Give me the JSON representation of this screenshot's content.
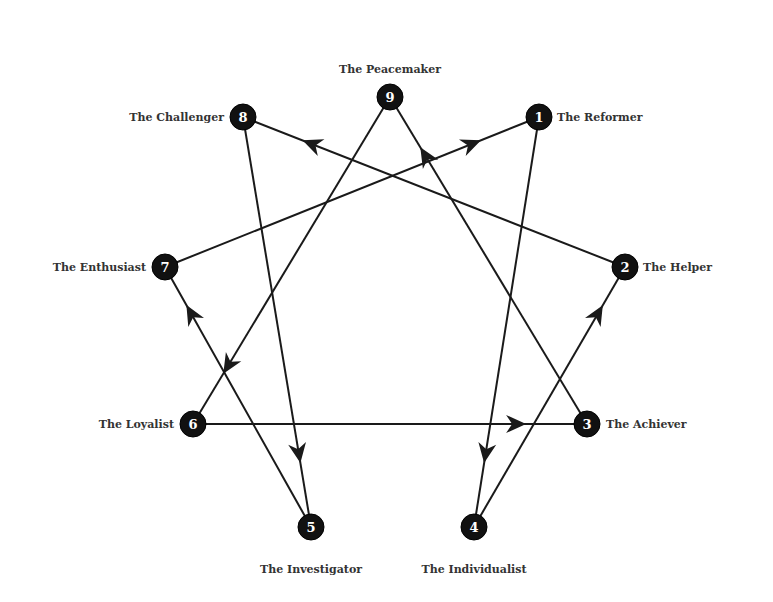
{
  "diagram": {
    "colors": {
      "node": "#111111",
      "line": "#1a1a1a",
      "label": "#333333",
      "background": "#ffffff"
    },
    "nodes": [
      {
        "id": "9",
        "label": "The Peacemaker",
        "x": 390,
        "y": 97,
        "lx": 390,
        "ly": 73,
        "anchor": "middle"
      },
      {
        "id": "1",
        "label": "The Reformer",
        "x": 539,
        "y": 117,
        "lx": 557,
        "ly": 121,
        "anchor": "start"
      },
      {
        "id": "2",
        "label": "The Helper",
        "x": 625,
        "y": 267,
        "lx": 643,
        "ly": 271,
        "anchor": "start"
      },
      {
        "id": "3",
        "label": "The Achiever",
        "x": 587,
        "y": 424,
        "lx": 606,
        "ly": 428,
        "anchor": "start"
      },
      {
        "id": "4",
        "label": "The Individualist",
        "x": 474,
        "y": 527,
        "lx": 474,
        "ly": 573,
        "anchor": "middle"
      },
      {
        "id": "5",
        "label": "The Investigator",
        "x": 311,
        "y": 527,
        "lx": 311,
        "ly": 573,
        "anchor": "middle"
      },
      {
        "id": "6",
        "label": "The Loyalist",
        "x": 193,
        "y": 424,
        "lx": 174,
        "ly": 428,
        "anchor": "end"
      },
      {
        "id": "7",
        "label": "The Enthusiast",
        "x": 165,
        "y": 267,
        "lx": 146,
        "ly": 271,
        "anchor": "end"
      },
      {
        "id": "8",
        "label": "The Challenger",
        "x": 243,
        "y": 117,
        "lx": 224,
        "ly": 121,
        "anchor": "end"
      }
    ],
    "edges": [
      {
        "from": "1",
        "to": "4"
      },
      {
        "from": "4",
        "to": "2"
      },
      {
        "from": "2",
        "to": "8"
      },
      {
        "from": "8",
        "to": "5"
      },
      {
        "from": "5",
        "to": "7"
      },
      {
        "from": "7",
        "to": "1"
      },
      {
        "from": "3",
        "to": "9"
      },
      {
        "from": "9",
        "to": "6"
      },
      {
        "from": "6",
        "to": "3"
      }
    ]
  }
}
